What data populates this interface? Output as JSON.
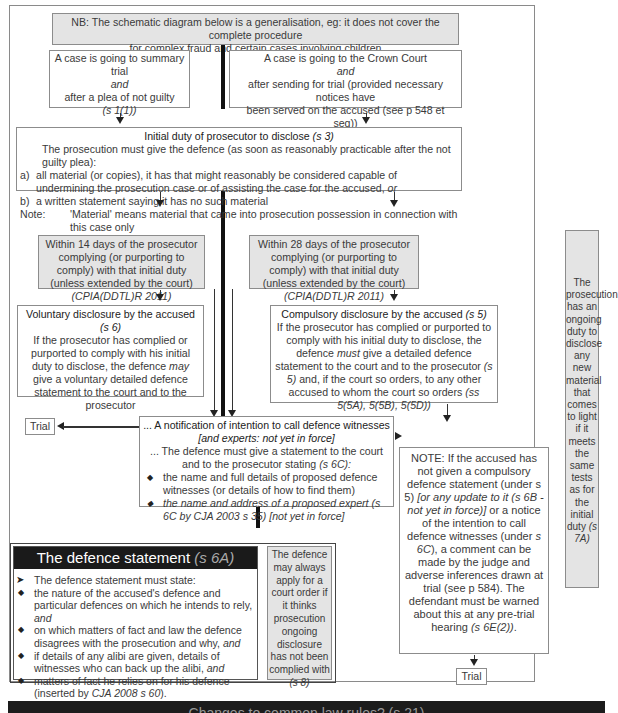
{
  "nb_note": {
    "line1": "NB: The schematic diagram below is a generalisation, eg: it does not cover the complete procedure",
    "line2": "for complex fraud and certain cases involving children"
  },
  "summary_trial": {
    "line1": "A case is going to summary trial",
    "and": "and",
    "line2": "after a plea of not guilty",
    "ref": "(s 1(1))"
  },
  "crown_court": {
    "line1": "A case is going to the Crown Court",
    "and": "and",
    "line2": "after sending for trial  (provided necessary notices have",
    "line3": "been served on the accused (see p 548 et seq))"
  },
  "initial_duty": {
    "title": "Initial duty of prosecutor to disclose",
    "title_ref": "(s 3)",
    "intro": "The prosecution must give the defence (as soon as reasonably practicable after the not guilty plea):",
    "item_a_label": "a)",
    "item_a": "all material (or copies), it has that might reasonably be considered capable of undermining the prosecution case or of assisting the case for the accused,",
    "item_a_or": "or",
    "item_b_label": "b)",
    "item_b": "a written statement saying it has no such material",
    "note_label": "Note:",
    "note": "'Material' means material that came into prosecution possession in connection with this case only"
  },
  "within_14": {
    "text": "Within 14 days of the prosecutor complying (or purporting to comply) with that initial duty (unless extended by the court)",
    "ref": "(CPIA(DDTL)R 2011)"
  },
  "within_28": {
    "text": "Within 28 days of the prosecutor complying (or purporting to comply) with that initial duty (unless extended by the court)",
    "ref": "(CPIA(DDTL)R 2011)"
  },
  "voluntary": {
    "title": "Voluntary disclosure by the accused",
    "title_ref": "(s 6)",
    "body_pre": "If the prosecutor has complied or purported to comply with his initial duty to disclose, the defence",
    "body_may": "may",
    "body_post": "give a voluntary detailed defence statement to the court and to the prosecutor"
  },
  "compulsory": {
    "title": "Compulsory disclosure by the accused",
    "title_ref": "(s 5)",
    "body_pre": "If the prosecutor has complied or purported to comply with his initial duty to disclose, the defence",
    "body_must": "must",
    "body_mid": "give a detailed defence statement to the court and to the prosecutor",
    "body_ref1": "(s 5)",
    "body_post": "and, if the court so orders, to any other accused to whom the court so orders",
    "body_ref2": "(ss 5(5A), 5(5B), 5(5D))"
  },
  "ongoing_duty": {
    "text": "The prosecution has an ongoing duty to disclose any new material that comes to light if it meets the same tests as for the initial duty",
    "ref": "(s 7A)"
  },
  "trial_left": {
    "label": "Trial"
  },
  "trial_right": {
    "label": "Trial"
  },
  "witness_notice": {
    "title": "... A notification of intention to call defence witnesses",
    "title_italic": "[and experts: not yet in force]",
    "intro": "... The defence must give a statement to the court and to the prosecutor stating",
    "intro_ref": "(s 6C):",
    "bullet1": "the name and full details of proposed defence witnesses (or details of how to find them)",
    "bullet2": "the name and address of a proposed expert (s 6C by CJA 2003 s 35) [not yet in force]"
  },
  "note_box": {
    "part1": "NOTE: If the accused has not given a compulsory defence statement (under s 5)",
    "part2_italic": "[or any update to it (s 6B - not yet in force)]",
    "part3": "or a notice of the intention to call defence witnesses (under",
    "part3_ref": "s 6C",
    "part4": "), a comment can be made by the judge and adverse inferences drawn at trial (see p 584). The defendant must be warned about this at any pre-trial hearing",
    "part4_ref": "(s 6E(2))",
    "part5": "."
  },
  "defence_statement": {
    "title": "The defence statement",
    "title_ref": "(s 6A)",
    "lead": "The defence statement must state:",
    "bullets": [
      "the nature of the accused's defence and particular defences on which he intends to rely,",
      "on which matters of fact and law the defence disagrees with the prosecution and why,",
      "if details of any alibi are given, details of witnesses who can back up the alibi,",
      "matters of fact he relies on for his defence (inserted by"
    ],
    "bullet_suffix_and": "and",
    "last_ref": "CJA 2008 s 60",
    "last_end": ")."
  },
  "court_order": {
    "text": "The defence may always apply for a court order if it thinks prosecution ongoing disclosure has not been complied with",
    "ref": "(s 8)"
  },
  "bottom_bar": {
    "text": "Changes to common law rules? (s 21)"
  }
}
